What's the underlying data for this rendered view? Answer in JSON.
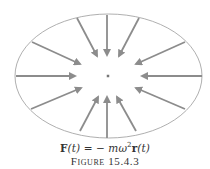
{
  "figure": {
    "ellipse": {
      "cx": 108.5,
      "cy": 76,
      "rx": 93.5,
      "ry": 62,
      "stroke": "#9a9a9a"
    },
    "center_point": {
      "x": 108,
      "y": 76
    },
    "arrow_color": "#8c8c8c",
    "arrows": [
      {
        "x1": 107,
        "y1": 15,
        "x2": 107,
        "y2": 55
      },
      {
        "x1": 77,
        "y1": 18,
        "x2": 97,
        "y2": 56
      },
      {
        "x1": 139,
        "y1": 18,
        "x2": 119,
        "y2": 56
      },
      {
        "x1": 32,
        "y1": 42,
        "x2": 80,
        "y2": 64
      },
      {
        "x1": 185,
        "y1": 42,
        "x2": 136,
        "y2": 64
      },
      {
        "x1": 16,
        "y1": 76,
        "x2": 75,
        "y2": 76
      },
      {
        "x1": 202,
        "y1": 76,
        "x2": 142,
        "y2": 76
      },
      {
        "x1": 31,
        "y1": 109,
        "x2": 81,
        "y2": 88
      },
      {
        "x1": 185,
        "y1": 109,
        "x2": 136,
        "y2": 88
      },
      {
        "x1": 107,
        "y1": 138,
        "x2": 107,
        "y2": 97
      },
      {
        "x1": 80,
        "y1": 131,
        "x2": 98,
        "y2": 97
      },
      {
        "x1": 136,
        "y1": 131,
        "x2": 117,
        "y2": 97
      }
    ]
  },
  "caption": {
    "equation_lhs": "F",
    "equation_arg1": "(t)",
    "equation_eq": " = − ",
    "equation_m": "m",
    "equation_omega": "ω",
    "equation_sup": "2",
    "equation_r": "r",
    "equation_arg2": "(t)",
    "label": "Figure 15.4.3"
  }
}
